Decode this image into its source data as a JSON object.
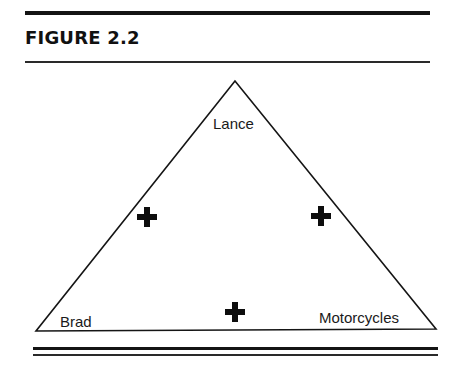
{
  "figure": {
    "title": "FIGURE 2.2"
  },
  "diagram": {
    "type": "balance-triangle",
    "nodes": {
      "top": {
        "label": "Lance"
      },
      "bottom_left": {
        "label": "Brad"
      },
      "bottom_right": {
        "label": "Motorcycles"
      }
    },
    "relations": [
      {
        "from": "Brad",
        "to": "Lance",
        "sign": "+",
        "symbol": "plus-icon"
      },
      {
        "from": "Lance",
        "to": "Motorcycles",
        "sign": "+",
        "symbol": "plus-icon"
      },
      {
        "from": "Brad",
        "to": "Motorcycles",
        "sign": "+",
        "symbol": "plus-icon"
      }
    ]
  }
}
